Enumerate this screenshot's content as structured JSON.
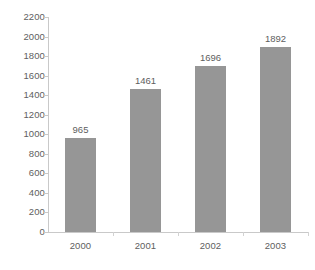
{
  "chart_data": {
    "type": "bar",
    "title": "",
    "subtitle": "",
    "xlabel": "",
    "ylabel": "",
    "categories": [
      "2000",
      "2001",
      "2002",
      "2003"
    ],
    "values": [
      965,
      1461,
      1696,
      1892
    ],
    "data_labels": [
      "965",
      "1461",
      "1696",
      "1892"
    ],
    "ylim": [
      0,
      2200
    ],
    "ytick_step": 200,
    "ytick_labels": [
      "2200",
      "2000",
      "1800",
      "1600",
      "1400",
      "1200",
      "1000",
      "800",
      "600",
      "400",
      "200",
      "0"
    ],
    "ytick_values": [
      2200,
      2000,
      1800,
      1600,
      1400,
      1200,
      1000,
      800,
      600,
      400,
      200,
      0
    ],
    "grid": false,
    "legend": false,
    "legend_position": "none",
    "series": [
      {
        "name": "",
        "values": [
          965,
          1461,
          1696,
          1892
        ],
        "color": "#969696"
      }
    ],
    "colors": {
      "bar_fill": "#969696",
      "axis_line": "#c9c9c9",
      "tick_mark": "#d2d2d2",
      "text": "#5e5e5e",
      "background": "#ffffff"
    }
  }
}
